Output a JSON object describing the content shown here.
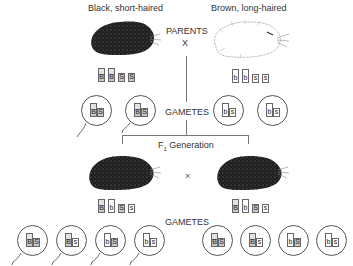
{
  "parents": {
    "left": {
      "label": "Black, short-haired",
      "coat": "black",
      "alleles": [
        {
          "letter": "B",
          "type": "tall",
          "dominant": true
        },
        {
          "letter": "B",
          "type": "tall",
          "dominant": true
        },
        {
          "letter": "S",
          "type": "short",
          "dominant": true
        },
        {
          "letter": "S",
          "type": "short",
          "dominant": true
        }
      ]
    },
    "right": {
      "label": "Brown, long-haired",
      "coat": "white-sketch",
      "alleles": [
        {
          "letter": "b",
          "type": "tall",
          "dominant": false
        },
        {
          "letter": "b",
          "type": "tall",
          "dominant": false
        },
        {
          "letter": "s",
          "type": "short",
          "dominant": false
        },
        {
          "letter": "s",
          "type": "short",
          "dominant": false
        }
      ]
    },
    "heading": "PARENTS",
    "cross_symbol": "X"
  },
  "parent_gametes": {
    "label": "GAMETES",
    "items": [
      {
        "genotype": "BS",
        "c1": "B",
        "c2": "S",
        "d1": true,
        "d2": true,
        "tail": true
      },
      {
        "genotype": "BS",
        "c1": "B",
        "c2": "S",
        "d1": true,
        "d2": true,
        "tail": true
      },
      {
        "genotype": "bs",
        "c1": "b",
        "c2": "s",
        "d1": false,
        "d2": false,
        "tail": false
      },
      {
        "genotype": "bs",
        "c1": "b",
        "c2": "s",
        "d1": false,
        "d2": false,
        "tail": false
      }
    ]
  },
  "f1": {
    "label_prefix": "F",
    "label_sub": "1",
    "label_suffix": " Generation",
    "cross_symbol": "×",
    "left_alleles": [
      {
        "letter": "B",
        "type": "tall",
        "dominant": true
      },
      {
        "letter": "b",
        "type": "tall",
        "dominant": false
      },
      {
        "letter": "S",
        "type": "short",
        "dominant": true
      },
      {
        "letter": "s",
        "type": "short",
        "dominant": false
      }
    ],
    "right_alleles": [
      {
        "letter": "B",
        "type": "tall",
        "dominant": true
      },
      {
        "letter": "b",
        "type": "tall",
        "dominant": false
      },
      {
        "letter": "S",
        "type": "short",
        "dominant": true
      },
      {
        "letter": "s",
        "type": "short",
        "dominant": false
      }
    ]
  },
  "f1_gametes": {
    "label": "GAMETES",
    "left": [
      {
        "genotype": "BS",
        "c1": "B",
        "c2": "S",
        "d1": true,
        "d2": true,
        "tail": true
      },
      {
        "genotype": "Bs",
        "c1": "B",
        "c2": "s",
        "d1": true,
        "d2": false,
        "tail": true
      },
      {
        "genotype": "bS",
        "c1": "b",
        "c2": "S",
        "d1": false,
        "d2": true,
        "tail": true
      },
      {
        "genotype": "bs",
        "c1": "b",
        "c2": "s",
        "d1": false,
        "d2": false,
        "tail": true
      }
    ],
    "right": [
      {
        "genotype": "BS",
        "c1": "B",
        "c2": "S",
        "d1": true,
        "d2": true,
        "tail": false
      },
      {
        "genotype": "Bs",
        "c1": "B",
        "c2": "s",
        "d1": true,
        "d2": false,
        "tail": false
      },
      {
        "genotype": "bS",
        "c1": "b",
        "c2": "S",
        "d1": false,
        "d2": true,
        "tail": false
      },
      {
        "genotype": "bs",
        "c1": "b",
        "c2": "s",
        "d1": false,
        "d2": false,
        "tail": false
      }
    ]
  },
  "colors": {
    "line": "#777777",
    "dominant_fill": "#c8c8c8",
    "text": "#333333"
  }
}
